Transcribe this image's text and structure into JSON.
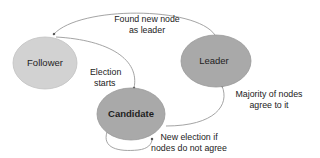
{
  "diagram": {
    "type": "state-machine",
    "colors": {
      "follower_fill": "#d2d2d2",
      "follower_stroke": "#c2c2c2",
      "active_fill": "#a9a9a9",
      "active_stroke": "#999999",
      "edge": "#9a9a9a",
      "text": "#1e1e1e"
    },
    "nodes": {
      "follower": {
        "label": "Follower"
      },
      "leader": {
        "label": "Leader"
      },
      "candidate": {
        "label": "Candidate"
      }
    },
    "edges": {
      "leader_to_follower": {
        "from": "Leader",
        "to": "Follower",
        "label_line1": "Found new node",
        "label_line2": "as leader"
      },
      "follower_to_candidate": {
        "from": "Follower",
        "to": "Candidate",
        "label_line1": "Election",
        "label_line2": "starts"
      },
      "candidate_to_leader": {
        "from": "Candidate",
        "to": "Leader",
        "label_line1": "Majority of nodes",
        "label_line2": "agree to it"
      },
      "candidate_self_loop": {
        "from": "Candidate",
        "to": "Candidate",
        "label_line1": "New election if",
        "label_line2": "nodes do not agree"
      }
    }
  }
}
